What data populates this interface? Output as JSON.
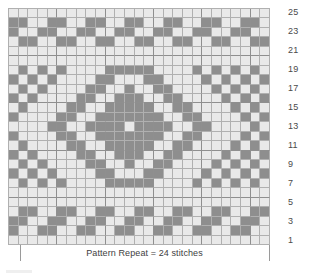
{
  "chart_data": {
    "type": "heatmap",
    "title": "",
    "subtitle": "",
    "xlabel": "",
    "ylabel": "",
    "caption": "Pattern Repeat = 24 stitches",
    "legend": [],
    "grid": true,
    "columns": 27,
    "rows": 25,
    "row_label_side": "right",
    "row_labels": [
      "1",
      "3",
      "5",
      "7",
      "9",
      "11",
      "13",
      "15",
      "17",
      "19",
      "21",
      "23",
      "25"
    ],
    "row_label_rows": [
      1,
      3,
      5,
      7,
      9,
      11,
      13,
      15,
      17,
      19,
      21,
      23,
      25
    ],
    "row_order": "bottom-to-top",
    "colors": {
      "empty": "#e9e9e9",
      "filled": "#8e8e8e",
      "gridline": "#b0b0b0",
      "gridline_major": "#8f8f8f"
    },
    "value_meaning": {
      "0": "main color stitch",
      "1": "contrast color stitch"
    },
    "repeat": {
      "stitches": 24,
      "marker_start_column": 2,
      "marker_end_column": 26
    },
    "matrix_row_order": "row25_to_row1",
    "matrix": [
      [
        0,
        0,
        0,
        0,
        0,
        0,
        0,
        0,
        0,
        0,
        0,
        0,
        0,
        0,
        0,
        0,
        0,
        0,
        0,
        0,
        0,
        0,
        0,
        0,
        0,
        0,
        0
      ],
      [
        1,
        1,
        0,
        0,
        1,
        1,
        0,
        0,
        1,
        1,
        0,
        0,
        1,
        1,
        0,
        0,
        1,
        1,
        0,
        0,
        1,
        1,
        0,
        0,
        1,
        1,
        0
      ],
      [
        1,
        0,
        0,
        1,
        1,
        0,
        0,
        1,
        1,
        0,
        0,
        1,
        1,
        0,
        0,
        1,
        1,
        0,
        0,
        1,
        1,
        0,
        0,
        1,
        1,
        0,
        0
      ],
      [
        0,
        1,
        1,
        0,
        0,
        1,
        1,
        0,
        0,
        1,
        1,
        0,
        0,
        1,
        1,
        0,
        0,
        1,
        1,
        0,
        0,
        1,
        1,
        0,
        0,
        1,
        1
      ],
      [
        0,
        0,
        0,
        0,
        0,
        0,
        0,
        0,
        0,
        0,
        0,
        0,
        0,
        0,
        0,
        0,
        0,
        0,
        0,
        0,
        0,
        0,
        0,
        0,
        0,
        0,
        0
      ],
      [
        0,
        0,
        0,
        0,
        0,
        0,
        0,
        0,
        0,
        0,
        0,
        0,
        0,
        0,
        0,
        0,
        0,
        0,
        0,
        0,
        0,
        0,
        0,
        0,
        0,
        0,
        0
      ],
      [
        0,
        1,
        0,
        1,
        0,
        1,
        0,
        0,
        0,
        0,
        1,
        1,
        1,
        1,
        1,
        0,
        0,
        0,
        0,
        1,
        0,
        1,
        0,
        1,
        0,
        1,
        0
      ],
      [
        1,
        0,
        1,
        0,
        1,
        0,
        0,
        0,
        0,
        1,
        1,
        0,
        0,
        0,
        1,
        1,
        0,
        0,
        0,
        0,
        1,
        0,
        1,
        0,
        1,
        0,
        1
      ],
      [
        0,
        1,
        0,
        1,
        0,
        0,
        0,
        0,
        1,
        1,
        0,
        0,
        1,
        0,
        0,
        1,
        1,
        0,
        0,
        0,
        0,
        1,
        0,
        1,
        0,
        1,
        0
      ],
      [
        1,
        0,
        1,
        0,
        0,
        0,
        0,
        1,
        1,
        0,
        0,
        1,
        1,
        1,
        0,
        0,
        1,
        1,
        0,
        0,
        0,
        0,
        1,
        0,
        1,
        0,
        1
      ],
      [
        0,
        1,
        0,
        0,
        0,
        0,
        1,
        1,
        0,
        0,
        1,
        1,
        1,
        1,
        1,
        0,
        0,
        1,
        1,
        0,
        0,
        0,
        0,
        1,
        0,
        1,
        0
      ],
      [
        1,
        0,
        0,
        0,
        0,
        1,
        1,
        0,
        0,
        1,
        1,
        1,
        1,
        1,
        1,
        1,
        0,
        0,
        1,
        1,
        0,
        0,
        0,
        0,
        1,
        0,
        1
      ],
      [
        0,
        0,
        0,
        0,
        1,
        1,
        0,
        0,
        1,
        1,
        1,
        1,
        0,
        1,
        1,
        1,
        1,
        0,
        0,
        1,
        1,
        0,
        0,
        0,
        0,
        1,
        0
      ],
      [
        1,
        0,
        0,
        0,
        0,
        1,
        1,
        0,
        0,
        1,
        1,
        1,
        1,
        1,
        1,
        1,
        0,
        0,
        1,
        1,
        0,
        0,
        0,
        0,
        1,
        0,
        1
      ],
      [
        0,
        1,
        0,
        0,
        0,
        0,
        1,
        1,
        0,
        0,
        1,
        1,
        1,
        1,
        1,
        0,
        0,
        1,
        1,
        0,
        0,
        0,
        0,
        1,
        0,
        1,
        0
      ],
      [
        1,
        0,
        1,
        0,
        0,
        0,
        0,
        1,
        1,
        0,
        0,
        1,
        1,
        1,
        0,
        0,
        1,
        1,
        0,
        0,
        0,
        0,
        1,
        0,
        1,
        0,
        1
      ],
      [
        0,
        1,
        0,
        1,
        0,
        0,
        0,
        0,
        1,
        1,
        0,
        0,
        1,
        0,
        0,
        1,
        1,
        0,
        0,
        0,
        0,
        1,
        0,
        1,
        0,
        1,
        0
      ],
      [
        1,
        0,
        1,
        0,
        1,
        0,
        0,
        0,
        0,
        1,
        1,
        0,
        0,
        0,
        1,
        1,
        0,
        0,
        0,
        0,
        1,
        0,
        1,
        0,
        1,
        0,
        1
      ],
      [
        0,
        1,
        0,
        1,
        0,
        1,
        0,
        0,
        0,
        0,
        1,
        1,
        1,
        1,
        1,
        0,
        0,
        0,
        0,
        1,
        0,
        1,
        0,
        1,
        0,
        1,
        0
      ],
      [
        0,
        0,
        0,
        0,
        0,
        0,
        0,
        0,
        0,
        0,
        0,
        0,
        0,
        0,
        0,
        0,
        0,
        0,
        0,
        0,
        0,
        0,
        0,
        0,
        0,
        0,
        0
      ],
      [
        0,
        0,
        0,
        0,
        0,
        0,
        0,
        0,
        0,
        0,
        0,
        0,
        0,
        0,
        0,
        0,
        0,
        0,
        0,
        0,
        0,
        0,
        0,
        0,
        0,
        0,
        0
      ],
      [
        0,
        1,
        1,
        0,
        0,
        1,
        1,
        0,
        0,
        1,
        1,
        0,
        0,
        1,
        1,
        0,
        0,
        1,
        1,
        0,
        0,
        1,
        1,
        0,
        0,
        1,
        1
      ],
      [
        1,
        1,
        0,
        0,
        1,
        1,
        0,
        0,
        1,
        1,
        0,
        0,
        1,
        1,
        0,
        0,
        1,
        1,
        0,
        0,
        1,
        1,
        0,
        0,
        1,
        1,
        0
      ],
      [
        1,
        0,
        0,
        1,
        1,
        0,
        0,
        1,
        1,
        0,
        0,
        1,
        1,
        0,
        0,
        1,
        1,
        0,
        0,
        1,
        1,
        0,
        0,
        1,
        1,
        0,
        0
      ],
      [
        0,
        0,
        0,
        0,
        0,
        0,
        0,
        0,
        0,
        0,
        0,
        0,
        0,
        0,
        0,
        0,
        0,
        0,
        0,
        0,
        0,
        0,
        0,
        0,
        0,
        0,
        0
      ]
    ]
  }
}
